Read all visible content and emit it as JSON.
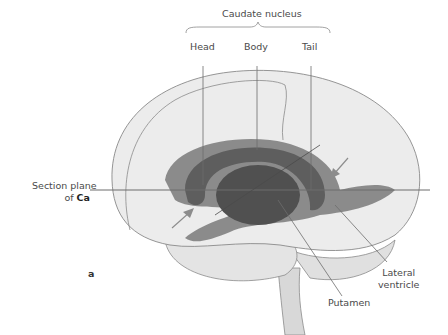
{
  "figure": {
    "panel_label": "a",
    "group_label": "Caudate nucleus",
    "labels": {
      "head": "Head",
      "body": "Body",
      "tail": "Tail",
      "section_plane_line1": "Section plane",
      "section_plane_line2_prefix": "of ",
      "section_plane_line2_bold": "Ca",
      "putamen": "Putamen",
      "lateral_ventricle_line1": "Lateral",
      "lateral_ventricle_line2": "ventricle"
    },
    "colors": {
      "brain_fill": "#ececec",
      "brain_outline": "#8a8a8a",
      "ventricle_fill": "#7a7a7a",
      "caudate_fill": "#5e5e5e",
      "putamen_fill": "#505050",
      "line_color": "#6d6d6d",
      "arrow_color": "#8c8c8c"
    }
  }
}
